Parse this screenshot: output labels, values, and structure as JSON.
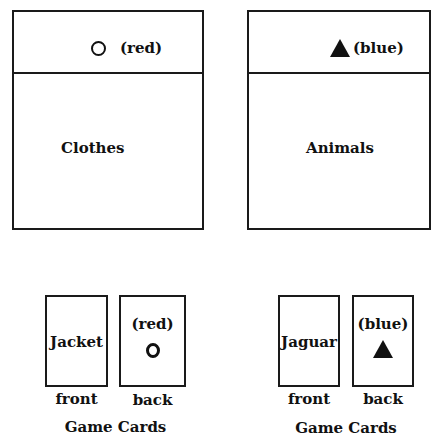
{
  "boxes": [
    {
      "header_symbol": "circle-outline",
      "header_color_label": "(red)",
      "category": "Clothes",
      "color": "red"
    },
    {
      "header_symbol": "triangle-filled",
      "header_color_label": "(blue)",
      "category": "Animals",
      "color": "blue"
    }
  ],
  "card_sets": [
    {
      "front_word": "Jacket",
      "back_color_label": "(red)",
      "back_symbol": "circle-outline",
      "front_caption": "front",
      "back_caption": "back",
      "title": "Game Cards"
    },
    {
      "front_word": "Jaguar",
      "back_color_label": "(blue)",
      "back_symbol": "triangle-filled",
      "front_caption": "front",
      "back_caption": "back",
      "title": "Game Cards"
    }
  ]
}
